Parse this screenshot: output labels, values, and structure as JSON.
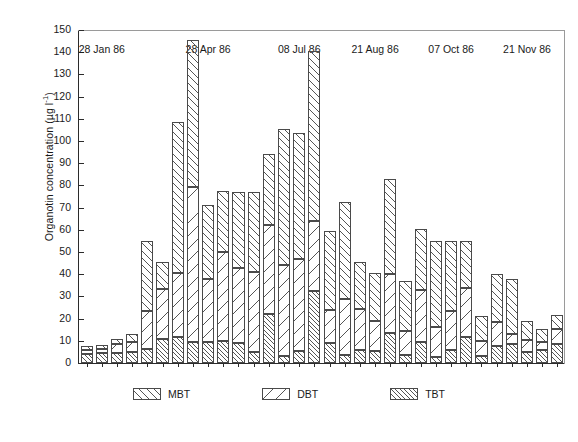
{
  "chart_data": {
    "type": "bar",
    "subtype": "stacked",
    "title": "",
    "xlabel": "",
    "ylabel": "Organotin concentration (µg l⁻¹)",
    "ylabel_text": "Organotin concentration",
    "ylabel_units": "(µg l",
    "ylabel_exponent": "-1",
    "ylim": [
      0,
      150
    ],
    "ytick_step": 10,
    "yticks": [
      0,
      10,
      20,
      30,
      40,
      50,
      60,
      70,
      80,
      90,
      100,
      110,
      120,
      130,
      140,
      150
    ],
    "grid": false,
    "legend_position": "bottom-center",
    "n_bars": 32,
    "xtick_labels": [
      "28 Jan 86",
      "28 Apr 86",
      "08 Jul 86",
      "21 Aug 86",
      "07 Oct 86",
      "21 Nov 86"
    ],
    "xtick_bar_index": [
      1,
      8,
      14,
      19,
      24,
      29
    ],
    "series": [
      {
        "name": "TBT",
        "hatch": "dense-diagonal",
        "values": [
          4.0,
          4.5,
          4.5,
          5.0,
          6.5,
          11.0,
          11.5,
          9.5,
          9.5,
          10.0,
          9.0,
          5.0,
          22.0,
          3.0,
          5.5,
          32.5,
          9.0,
          3.5,
          6.0,
          5.5,
          13.5,
          3.5,
          9.5,
          2.5,
          6.0,
          11.5,
          3.0,
          7.5,
          8.5,
          5.0,
          6.0,
          8.5
        ]
      },
      {
        "name": "DBT",
        "hatch": "sparse-diagonal",
        "values": [
          2.0,
          2.0,
          4.0,
          4.5,
          17.0,
          22.5,
          29.0,
          70.0,
          28.5,
          40.0,
          34.0,
          36.0,
          40.0,
          41.0,
          41.5,
          31.5,
          15.0,
          25.5,
          18.5,
          13.5,
          26.5,
          11.0,
          23.5,
          13.5,
          17.5,
          22.5,
          7.0,
          11.0,
          4.5,
          5.5,
          3.5,
          7.0
        ]
      },
      {
        "name": "MBT",
        "hatch": "medium-diagonal",
        "values": [
          1.5,
          1.5,
          2.5,
          3.5,
          31.5,
          12.0,
          68.0,
          66.0,
          33.0,
          27.5,
          34.0,
          36.0,
          32.0,
          61.5,
          56.5,
          76.5,
          35.5,
          43.5,
          21.0,
          21.5,
          43.0,
          22.5,
          27.5,
          39.0,
          31.5,
          21.0,
          11.0,
          21.5,
          25.0,
          8.5,
          6.0,
          6.0
        ]
      }
    ],
    "bar_totals": [
      7.5,
      8.0,
      11.0,
      13.0,
      55.0,
      45.5,
      108.5,
      145.5,
      71.0,
      77.5,
      77.0,
      77.0,
      94.0,
      105.5,
      103.5,
      140.5,
      59.5,
      72.5,
      45.5,
      40.5,
      83.0,
      37.0,
      60.5,
      55.0,
      55.0,
      55.0,
      21.0,
      40.0,
      38.0,
      19.0,
      15.5,
      21.5
    ]
  },
  "legend": {
    "items": [
      {
        "label": "MBT",
        "swatch": "mbt"
      },
      {
        "label": "DBT",
        "swatch": "dbt"
      },
      {
        "label": "TBT",
        "swatch": "tbt"
      }
    ]
  }
}
